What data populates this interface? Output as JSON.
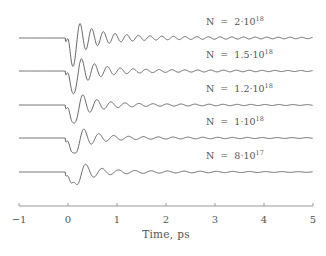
{
  "chart_data": {
    "type": "line",
    "title": "",
    "xlabel": "Time, ps",
    "ylabel": "",
    "xlim": [
      -1,
      5
    ],
    "xticks": [
      "-1",
      "0",
      "1",
      "2",
      "3",
      "4",
      "5"
    ],
    "grid": false,
    "legend": "inline labels above each trace",
    "layout": "vertically offset stacked traces",
    "series": [
      {
        "name": "N = 2·10^18",
        "label_prefix": "N  =  2·10",
        "label_exp": "18",
        "frequency_thz": 4.2,
        "pulse_onset_ps": -0.05,
        "initial_amplitude": 1.0,
        "decay_ps": 0.45,
        "residual_amplitude": 0.12,
        "residual_decay_ps": 3.5
      },
      {
        "name": "N = 1.5·10^18",
        "label_prefix": "N  =  1.5·10",
        "label_exp": "18",
        "frequency_thz": 3.8,
        "pulse_onset_ps": -0.05,
        "initial_amplitude": 1.0,
        "decay_ps": 0.4,
        "residual_amplitude": 0.1,
        "residual_decay_ps": 3.2
      },
      {
        "name": "N = 1.2·10^18",
        "label_prefix": "N  =  1.2·10",
        "label_exp": "18",
        "frequency_thz": 3.5,
        "pulse_onset_ps": -0.05,
        "initial_amplitude": 1.0,
        "decay_ps": 0.35,
        "residual_amplitude": 0.09,
        "residual_decay_ps": 3.0
      },
      {
        "name": "N = 1·10^18",
        "label_prefix": "N  =  1·10",
        "label_exp": "18",
        "frequency_thz": 3.3,
        "pulse_onset_ps": -0.05,
        "initial_amplitude": 1.0,
        "decay_ps": 0.32,
        "residual_amplitude": 0.09,
        "residual_decay_ps": 2.8
      },
      {
        "name": "N = 8·10^17",
        "label_prefix": "N  =  8·10",
        "label_exp": "17",
        "frequency_thz": 3.0,
        "pulse_onset_ps": -0.05,
        "initial_amplitude": 1.0,
        "decay_ps": 0.3,
        "residual_amplitude": 0.1,
        "residual_decay_ps": 2.5
      }
    ],
    "colors": {
      "trace": "#555555",
      "axis": "#999999",
      "text": "#555555"
    }
  }
}
